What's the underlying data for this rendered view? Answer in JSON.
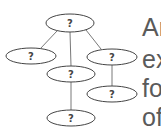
{
  "diagram": {
    "type": "tree",
    "stroke_color": "#555555",
    "nodes": [
      {
        "id": "root",
        "label": "?",
        "cx": 70,
        "cy": 23,
        "rx": 24,
        "ry": 9
      },
      {
        "id": "left",
        "label": "?",
        "cx": 31,
        "cy": 56,
        "rx": 25,
        "ry": 8
      },
      {
        "id": "middle",
        "label": "?",
        "cx": 71,
        "cy": 74,
        "rx": 24,
        "ry": 8
      },
      {
        "id": "right",
        "label": "?",
        "cx": 112,
        "cy": 57,
        "rx": 25,
        "ry": 8
      },
      {
        "id": "right-child",
        "label": "?",
        "cx": 112,
        "cy": 94,
        "rx": 25,
        "ry": 8
      },
      {
        "id": "middle-child",
        "label": "?",
        "cx": 71,
        "cy": 118,
        "rx": 24,
        "ry": 8
      }
    ],
    "edges": [
      {
        "from": "root",
        "to": "left"
      },
      {
        "from": "root",
        "to": "middle"
      },
      {
        "from": "root",
        "to": "right"
      },
      {
        "from": "middle",
        "to": "middle-child"
      },
      {
        "from": "right",
        "to": "right-child"
      }
    ]
  },
  "side_text": {
    "lines": [
      "Ar",
      "ex",
      "fo",
      "of"
    ],
    "color": "#5a5a5a"
  }
}
